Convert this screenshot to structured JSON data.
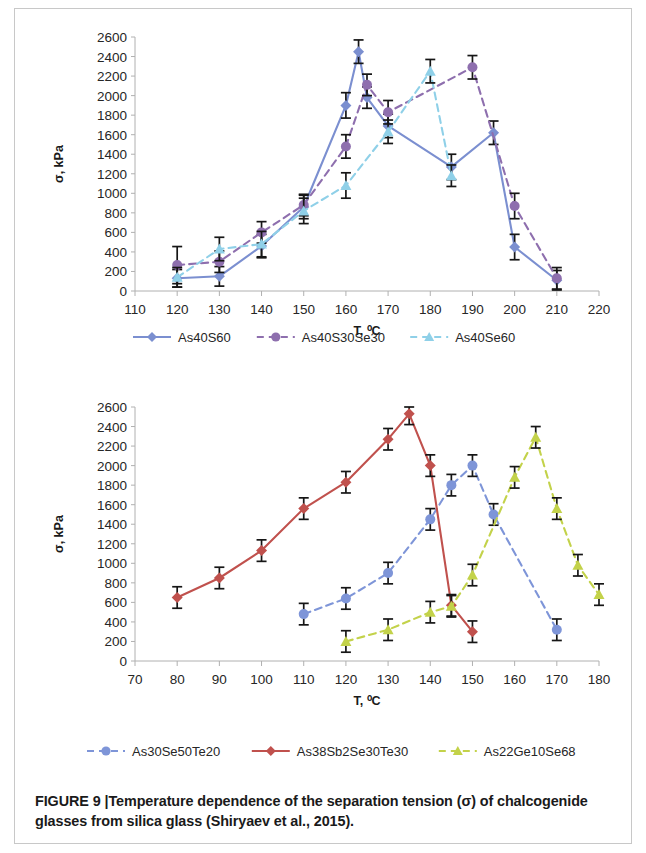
{
  "caption": {
    "label": "FIGURE 9",
    "separator": "|",
    "text": "Temperature dependence of the separation tension (σ) of chalcogenide glasses from silica glass (Shiryaev et al., 2015)."
  },
  "colors": {
    "series_as40s60": "#7b8fd0",
    "series_as40s30se30": "#8e6fae",
    "series_as40se60": "#8fd0e8",
    "series_as30se50te20": "#7e95d8",
    "series_as38sb2se30te30": "#c0514d",
    "series_as22ge10se68": "#c3d24a",
    "axis": "#b0b0b0",
    "error_bar": "#161616",
    "text": "#262626",
    "frame_border": "#c8c8c8"
  },
  "chart_data": [
    {
      "id": "chart1",
      "type": "line",
      "title": "",
      "xlabel": "T, ⁰C",
      "ylabel": "σ, kPa",
      "xlim": [
        110,
        220
      ],
      "ylim": [
        0,
        2600
      ],
      "xticks": [
        110,
        120,
        130,
        140,
        150,
        160,
        170,
        180,
        190,
        200,
        210,
        220
      ],
      "yticks": [
        0,
        200,
        400,
        600,
        800,
        1000,
        1200,
        1400,
        1600,
        1800,
        2000,
        2200,
        2400,
        2600
      ],
      "grid": false,
      "legend_position": "bottom",
      "series": [
        {
          "name": "As40S60",
          "color": "#7b8fd0",
          "style": "solid",
          "marker": "diamond",
          "x": [
            120,
            130,
            140,
            150,
            160,
            163,
            165,
            170,
            185,
            195,
            200,
            210
          ],
          "y": [
            130,
            150,
            460,
            860,
            1900,
            2450,
            1980,
            1690,
            1270,
            1620,
            450,
            110
          ],
          "yerr": [
            90,
            100,
            120,
            120,
            130,
            120,
            110,
            120,
            130,
            120,
            130,
            100
          ]
        },
        {
          "name": "As40S30Se30",
          "color": "#8e6fae",
          "style": "dashed",
          "marker": "circle",
          "x": [
            120,
            130,
            140,
            150,
            160,
            165,
            170,
            190,
            200,
            210
          ],
          "y": [
            265,
            300,
            600,
            880,
            1480,
            2110,
            1830,
            2290,
            870,
            130
          ],
          "yerr": [
            190,
            110,
            110,
            110,
            120,
            110,
            120,
            120,
            130,
            110
          ]
        },
        {
          "name": "As40Se60",
          "color": "#8fd0e8",
          "style": "dashed",
          "marker": "triangle",
          "x": [
            120,
            130,
            140,
            150,
            160,
            170,
            180,
            185
          ],
          "y": [
            140,
            430,
            480,
            820,
            1080,
            1630,
            2250,
            1180
          ],
          "yerr": [
            100,
            120,
            130,
            130,
            130,
            120,
            120,
            110
          ]
        }
      ]
    },
    {
      "id": "chart2",
      "type": "line",
      "title": "",
      "xlabel": "T, ⁰C",
      "ylabel": "σ, kPa",
      "xlim": [
        70,
        180
      ],
      "ylim": [
        0,
        2600
      ],
      "xticks": [
        70,
        80,
        90,
        100,
        110,
        120,
        130,
        140,
        150,
        160,
        170,
        180
      ],
      "yticks": [
        0,
        200,
        400,
        600,
        800,
        1000,
        1200,
        1400,
        1600,
        1800,
        2000,
        2200,
        2400,
        2600
      ],
      "grid": false,
      "legend_position": "bottom",
      "series": [
        {
          "name": "As30Se50Te20",
          "color": "#7e95d8",
          "style": "dashed",
          "marker": "circle",
          "x": [
            110,
            120,
            130,
            140,
            145,
            150,
            155,
            170
          ],
          "y": [
            480,
            640,
            900,
            1450,
            1800,
            2000,
            1500,
            320
          ],
          "yerr": [
            110,
            110,
            110,
            110,
            110,
            110,
            110,
            110
          ]
        },
        {
          "name": "As38Sb2Se30Te30",
          "color": "#c0514d",
          "style": "solid",
          "marker": "diamond",
          "x": [
            80,
            90,
            100,
            110,
            120,
            130,
            135,
            140,
            145,
            150
          ],
          "y": [
            650,
            850,
            1130,
            1560,
            1830,
            2270,
            2530,
            2000,
            570,
            300
          ],
          "yerr": [
            110,
            110,
            110,
            110,
            110,
            110,
            110,
            110,
            110,
            110
          ]
        },
        {
          "name": "As22Ge10Se68",
          "color": "#c3d24a",
          "style": "dashed",
          "marker": "triangle",
          "x": [
            120,
            130,
            140,
            145,
            150,
            160,
            165,
            170,
            175,
            180
          ],
          "y": [
            200,
            320,
            500,
            560,
            880,
            1880,
            2290,
            1560,
            980,
            680
          ],
          "yerr": [
            110,
            110,
            110,
            110,
            110,
            110,
            110,
            110,
            110,
            110
          ]
        }
      ]
    }
  ]
}
